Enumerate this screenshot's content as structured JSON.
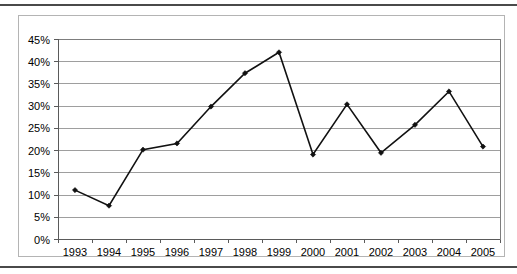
{
  "page": {
    "top_rule": "horizontal-rule",
    "bottom_rule": "horizontal-rule"
  },
  "chart_data": {
    "type": "line",
    "title": "",
    "subtitle": "",
    "xlabel": "",
    "ylabel": "",
    "categories": [
      "1993",
      "1994",
      "1995",
      "1996",
      "1997",
      "1998",
      "1999",
      "2000",
      "2001",
      "2002",
      "2003",
      "2004",
      "2005"
    ],
    "values": [
      11.0,
      7.5,
      20.1,
      21.5,
      29.8,
      37.3,
      42.0,
      19.0,
      30.3,
      19.4,
      25.7,
      33.2,
      20.8
    ],
    "value_suffix": "%",
    "ytick_labels": [
      "0%",
      "5%",
      "10%",
      "15%",
      "20%",
      "25%",
      "30%",
      "35%",
      "40%",
      "45%"
    ],
    "ytick_values": [
      0,
      5,
      10,
      15,
      20,
      25,
      30,
      35,
      40,
      45
    ],
    "ylim": [
      0,
      45
    ],
    "grid": true,
    "legend": false,
    "legend_position": "none",
    "marker": "diamond",
    "line_color": "#111111",
    "grid_color": "#9e9e9e",
    "axis_color": "#5a5a5a",
    "plot_border_color": "#7d7d7d",
    "frame_border_color": "#b4b4b4",
    "rule_color": "#4a4a4a"
  }
}
